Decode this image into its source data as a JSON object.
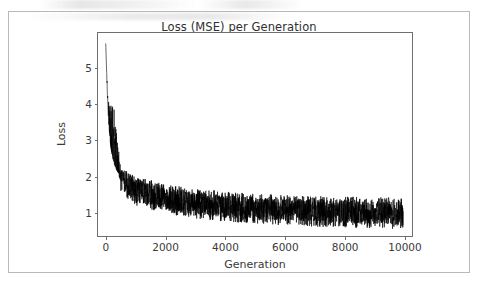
{
  "figure": {
    "title": "Loss (MSE) per Generation",
    "background_color": "#ffffff",
    "border_color": "#b9b9b9",
    "line_color": "#000000",
    "axis_color": "#6e6e6e"
  },
  "chart_data": {
    "type": "line",
    "title": "Loss (MSE) per Generation",
    "xlabel": "Generation",
    "ylabel": "Loss",
    "xlim": [
      -260,
      10300
    ],
    "ylim": [
      0.32,
      5.95
    ],
    "xticks": [
      0,
      2000,
      4000,
      6000,
      8000,
      10000
    ],
    "xtick_labels": [
      "0",
      "2000",
      "4000",
      "6000",
      "8000",
      "10000"
    ],
    "yticks": [
      1,
      2,
      3,
      4,
      5
    ],
    "ytick_labels": [
      "1",
      "2",
      "3",
      "4",
      "5"
    ],
    "grid": false,
    "legend": null,
    "series": [
      {
        "name": "Loss (MSE)",
        "color": "#000000",
        "linewidth": 0.6,
        "description": "Per-generation mean squared error of a genetic-algorithm run; a very steep decay from ~5.65 at generation 0 down to ~2 by generation ~500, then a slow noisy decline converging to a band centred near 0.95 by generation 10000.",
        "trend_x": [
          0,
          50,
          100,
          150,
          200,
          300,
          400,
          500,
          700,
          1000,
          1500,
          2000,
          2500,
          3000,
          3500,
          4000,
          4500,
          5000,
          5500,
          6000,
          6500,
          7000,
          7500,
          8000,
          8500,
          9000,
          9500,
          10000
        ],
        "trend_y": [
          5.65,
          4.35,
          3.45,
          2.95,
          2.62,
          2.28,
          2.1,
          1.98,
          1.8,
          1.62,
          1.45,
          1.35,
          1.28,
          1.24,
          1.2,
          1.17,
          1.14,
          1.12,
          1.1,
          1.08,
          1.06,
          1.05,
          1.03,
          1.02,
          1.0,
          0.99,
          0.97,
          0.95
        ],
        "noise_band_x": [
          0,
          500,
          1000,
          2000,
          3000,
          4000,
          5000,
          6000,
          7000,
          8000,
          9000,
          10000
        ],
        "noise_upper": [
          5.65,
          2.2,
          1.95,
          1.72,
          1.6,
          1.52,
          1.46,
          1.42,
          1.4,
          1.38,
          1.36,
          1.35
        ],
        "noise_lower": [
          5.65,
          1.55,
          1.2,
          0.98,
          0.84,
          0.76,
          0.7,
          0.66,
          0.62,
          0.6,
          0.57,
          0.55
        ]
      }
    ],
    "annotations": []
  }
}
